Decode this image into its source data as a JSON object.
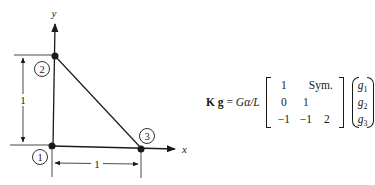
{
  "diagram": {
    "axes": {
      "x_label": "x",
      "y_label": "y"
    },
    "nodes": [
      {
        "id": "1",
        "label": "1",
        "x": 0,
        "y": 0
      },
      {
        "id": "2",
        "label": "2",
        "x": 0,
        "y": 1
      },
      {
        "id": "3",
        "label": "3",
        "x": 1,
        "y": 0
      }
    ],
    "dimensions": {
      "vertical": "1",
      "horizontal": "1"
    }
  },
  "equation": {
    "lhs_bold_K": "K",
    "lhs_bold_g": "g",
    "equals": "=",
    "factor": "Gα/L",
    "matrix": {
      "row1": [
        "1",
        "Sym."
      ],
      "row2": [
        "0",
        "1"
      ],
      "row3": [
        "−1",
        "−1",
        "2"
      ]
    },
    "vector": [
      {
        "base": "g",
        "sub": "1"
      },
      {
        "base": "g",
        "sub": "2"
      },
      {
        "base": "g",
        "sub": "3"
      }
    ]
  }
}
